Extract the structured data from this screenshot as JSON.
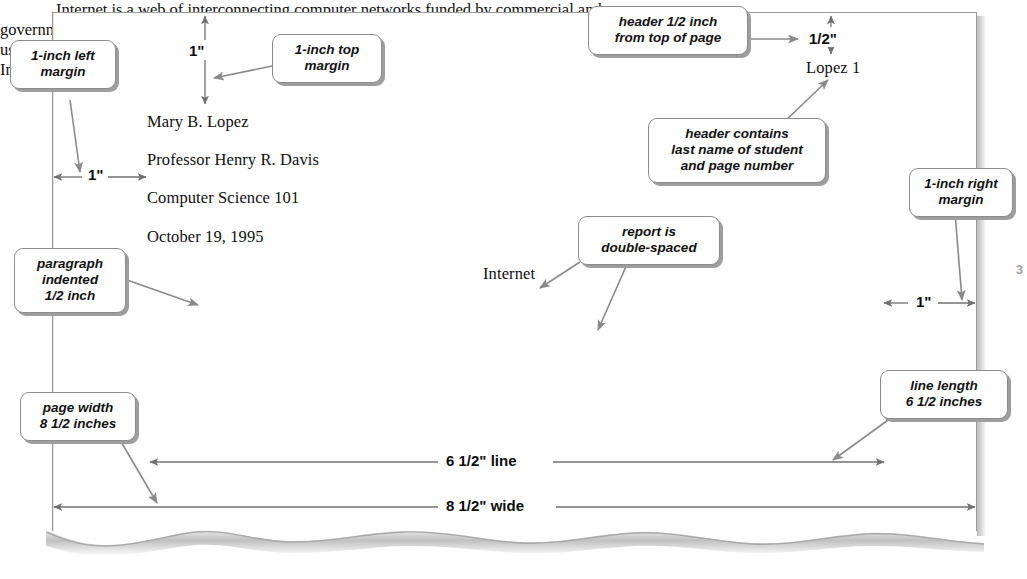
{
  "document": {
    "header": "Lopez 1",
    "heading_lines": [
      "Mary B. Lopez",
      "Professor Henry R. Davis",
      "Computer Science 101",
      "October 19, 1995"
    ],
    "title": "Internet",
    "body_lines": [
      "Internet is a web of interconnecting computer networks funded by commercial and",
      "governmental organizations that allows computer-to-computer communication by millions of",
      "users throughout the world. More than one million computers of all sizes are now connected to",
      "Internet."
    ]
  },
  "callouts": {
    "left_margin": "1-inch left\nmargin",
    "top_margin": "1-inch top\nmargin",
    "header_half_inch": "header 1/2 inch\nfrom top of page",
    "header_contents": "header contains\nlast name of student\nand page number",
    "right_margin": "1-inch right\nmargin",
    "double_spaced": "report is\ndouble-spaced",
    "paragraph_indent": "paragraph\nindented\n1/2 inch",
    "page_width": "page width\n8 1/2 inches",
    "line_length": "line length\n6 1/2 inches"
  },
  "dimensions": {
    "top_margin": "1\"",
    "left_margin": "1\"",
    "header_offset": "1/2\"",
    "right_margin": "1\"",
    "line_length": "6 1/2\" line",
    "page_width": "8 1/2\" wide",
    "edge_artifact": "3"
  },
  "colors": {
    "paper_border": "#9a9a9a",
    "callout_border": "#8d8d8d",
    "callout_shadow": "#9e9e9e",
    "arrow": "#8a8a8a",
    "dimension_arrow": "#6f6f6f",
    "text": "#101010",
    "torn_edge": "#b7b7b7"
  }
}
